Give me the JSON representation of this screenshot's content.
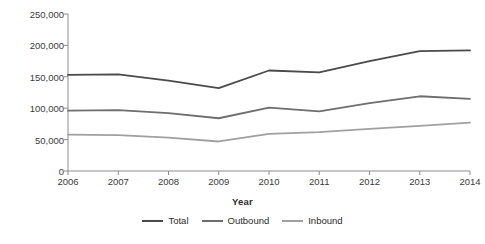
{
  "chart_data": {
    "type": "line",
    "title": "",
    "xlabel": "Year",
    "ylabel": "Metric tons",
    "categories": [
      "2006",
      "2007",
      "2008",
      "2009",
      "2010",
      "2011",
      "2012",
      "2013",
      "2014"
    ],
    "x": [
      2006,
      2007,
      2008,
      2009,
      2010,
      2011,
      2012,
      2013,
      2014
    ],
    "xlim": [
      2006,
      2014
    ],
    "ylim": [
      0,
      250000
    ],
    "yticks": [
      0,
      50000,
      100000,
      150000,
      200000,
      250000
    ],
    "ytick_labels": [
      "0",
      "50,000",
      "100,000",
      "150,000",
      "200,000",
      "250,000"
    ],
    "xtick_labels": [
      "2006",
      "2007",
      "2008",
      "2009",
      "2010",
      "2011",
      "2012",
      "2013",
      "2014"
    ],
    "grid": false,
    "legend_position": "bottom",
    "series": [
      {
        "name": "Total",
        "color": "#4a4a4a",
        "values": [
          153000,
          154000,
          144000,
          132000,
          160000,
          157000,
          175000,
          191000,
          192000
        ]
      },
      {
        "name": "Outbound",
        "color": "#6e6e6e",
        "values": [
          96000,
          97000,
          92000,
          84000,
          101000,
          95000,
          108000,
          119000,
          115000
        ]
      },
      {
        "name": "Inbound",
        "color": "#a0a0a0",
        "values": [
          58000,
          57000,
          53000,
          47000,
          59000,
          62000,
          67000,
          72000,
          77000
        ]
      }
    ]
  },
  "axis": {
    "line_color": "#8c8c8c"
  }
}
